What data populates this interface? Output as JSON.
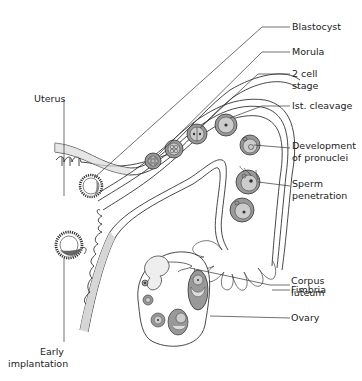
{
  "diagram": {
    "type": "anatomical-illustration",
    "colors": {
      "line": "#333333",
      "cell_fill": "#9a9a9a",
      "cell_inner": "#c8c8c8",
      "wall_shade": "#dcdcdc",
      "background": "#ffffff"
    },
    "labels": {
      "blastocyst": "Blastocyst",
      "morula": "Morula",
      "two_cell_1": "2 cell",
      "two_cell_2": "stage",
      "first_cleavage": "Ist. cleavage",
      "pronuclei_1": "Development",
      "pronuclei_2": "of pronuclei",
      "sperm_1": "Sperm",
      "sperm_2": "penetration",
      "fimbria": "Fimbria",
      "corpus_1": "Corpus",
      "corpus_2": "luteum",
      "ovary": "Ovary",
      "uterus": "Uterus",
      "implant_1": "Early",
      "implant_2": "implantation"
    }
  }
}
